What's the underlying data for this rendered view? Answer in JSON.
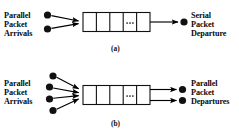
{
  "figure": {
    "type": "diagram",
    "title": "",
    "background_color": "#ffffff",
    "ink_color": "#000000",
    "panels": [
      {
        "id": "a",
        "caption": "(a)",
        "input_label": {
          "lines": [
            "Parallel",
            "Packet",
            "Arrivals"
          ]
        },
        "output_label": {
          "lines": [
            "Serial",
            "Packet",
            "Departure"
          ]
        },
        "input_node_count": 2,
        "output_node_count": 1,
        "queue": {
          "cells": 5,
          "ellipsis": "...",
          "ellipsis_cell_index": 3
        },
        "arrows_in": 2,
        "arrows_out": 1
      },
      {
        "id": "b",
        "caption": "(b)",
        "input_label": {
          "lines": [
            "Parallel",
            "Packet",
            "Arrivals"
          ]
        },
        "output_label": {
          "lines": [
            "Parallel",
            "Packet",
            "Departures"
          ]
        },
        "input_node_count": 4,
        "output_node_count": 2,
        "queue": {
          "cells": 5,
          "ellipsis": "...",
          "ellipsis_cell_index": 3
        },
        "arrows_in": 4,
        "arrows_out": 2
      }
    ]
  }
}
